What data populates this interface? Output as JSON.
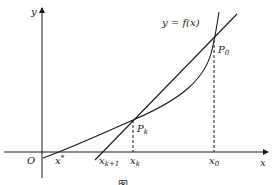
{
  "figure": {
    "type": "newton-method-illustration",
    "curve_label": "y = f(x)",
    "axes": {
      "x_label": "x",
      "y_label": "y",
      "origin_label": "O"
    },
    "points": {
      "p0": "P",
      "p0_sub": "0",
      "pk": "P",
      "pk_sub": "k"
    },
    "x_ticks": {
      "root": "x",
      "root_sup": "*",
      "xk1": "x",
      "xk1_sub": "k+1",
      "xk": "x",
      "xk_sub": "k",
      "x0": "x",
      "x0_sub": "0"
    },
    "caption": "图"
  },
  "colors": {
    "stroke": "#1a1a1a",
    "background": "#ffffff"
  }
}
